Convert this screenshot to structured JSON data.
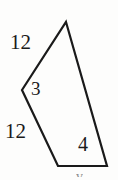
{
  "figure": {
    "kind": "geometry-polygon-diagram",
    "background_color": "#fdfdfc",
    "stroke_color": "#1a1a1a",
    "text_color": "#1a1a1a",
    "width": 118,
    "height": 180
  },
  "shape": {
    "name": "concave-quadrilateral",
    "points": "66,22 107,166 58,166 22,90",
    "vertices": [
      {
        "name": "top-vertex",
        "x": 66,
        "y": 22
      },
      {
        "name": "bottom-right-vertex",
        "x": 107,
        "y": 166
      },
      {
        "name": "bottom-left-vertex",
        "x": 58,
        "y": 166
      },
      {
        "name": "left-reflex-vertex",
        "x": 22,
        "y": 90
      }
    ],
    "stroke_width": 2.2
  },
  "labels": {
    "top_left_side": "12",
    "left_vertex": "3",
    "bottom_left_side": "12",
    "bottom_right_interior": "4",
    "cut_off_bottom": "v"
  }
}
